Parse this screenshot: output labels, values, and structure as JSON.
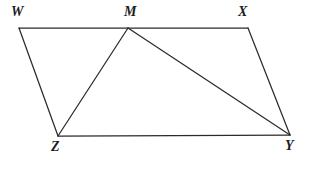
{
  "figure": {
    "name": "quadrilateral-wxyz-with-cevians",
    "canvas": {
      "width": 309,
      "height": 169
    },
    "background_color": "#ffffff",
    "stroke_color": "#2b2b2b",
    "stroke_width": 1.25,
    "label_color": "#1c1c1c",
    "points": [
      {
        "id": "W",
        "label": "W",
        "x": 19,
        "y": 28,
        "label_x": 11,
        "label_y": 5
      },
      {
        "id": "M",
        "label": "M",
        "x": 128,
        "y": 28,
        "label_x": 124,
        "label_y": 5
      },
      {
        "id": "X",
        "label": "X",
        "x": 248,
        "y": 28,
        "label_x": 238,
        "label_y": 5
      },
      {
        "id": "Z",
        "label": "Z",
        "x": 58,
        "y": 136,
        "label_x": 51,
        "label_y": 140
      },
      {
        "id": "Y",
        "label": "Y",
        "x": 290,
        "y": 135,
        "label_x": 285,
        "label_y": 139
      }
    ],
    "segments": [
      {
        "id": "WX",
        "from": "W",
        "to": "X",
        "path": "M 19 28 L 248 28"
      },
      {
        "id": "XY",
        "from": "X",
        "to": "Y",
        "path": "M 248 28 L 290 135"
      },
      {
        "id": "YZ",
        "from": "Y",
        "to": "Z",
        "path": "M 290 135 L 58 136"
      },
      {
        "id": "ZW",
        "from": "Z",
        "to": "W",
        "path": "M 58 136 L 19 28"
      },
      {
        "id": "MZ",
        "from": "M",
        "to": "Z",
        "path": "M 128 28 L 58 136"
      },
      {
        "id": "MY",
        "from": "M",
        "to": "Y",
        "path": "M 128 28 L 290 135"
      }
    ]
  }
}
